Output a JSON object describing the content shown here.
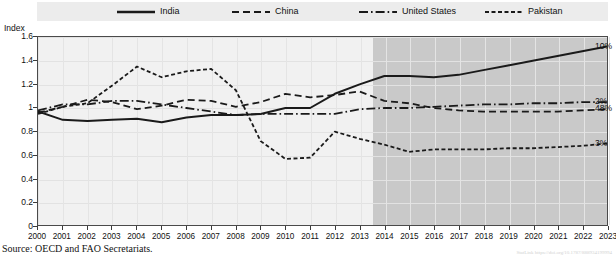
{
  "index_axis_title": "Index",
  "source_note": "Source:  OECD and FAO Secretariats.",
  "doi_note": "StatLink https://doi.org/10.1787/888934199994",
  "colors": {
    "line": "#1a1a1a",
    "plot_background": "#f1f1f1",
    "projection_shade": "#c9c9c9",
    "legend_background": "#ececec",
    "frame": "#4a4a4a"
  },
  "legend": {
    "items": [
      {
        "label": "India",
        "style": "solid",
        "name": "legend-item-india"
      },
      {
        "label": "China",
        "style": "dashed",
        "name": "legend-item-china"
      },
      {
        "label": "United States",
        "style": "dash-dot",
        "name": "legend-item-united-states"
      },
      {
        "label": "Pakistan",
        "style": "short-dashed",
        "name": "legend-item-pakistan"
      }
    ]
  },
  "chart_data": {
    "type": "line",
    "title": "",
    "xlabel": "",
    "ylabel": "Index",
    "ylim": [
      0,
      1.6
    ],
    "xlim": [
      2000,
      2023
    ],
    "grid": true,
    "legend_position": "top",
    "projection_start": 2013.5,
    "yticks": [
      "0",
      "0.2",
      "0.4",
      "0.6",
      "0.8",
      "1",
      "1.2",
      "1.4",
      "1.6"
    ],
    "ytick_values": [
      0,
      0.2,
      0.4,
      0.6,
      0.8,
      1.0,
      1.2,
      1.4,
      1.6
    ],
    "x": [
      2000,
      2001,
      2002,
      2003,
      2004,
      2005,
      2006,
      2007,
      2008,
      2009,
      2010,
      2011,
      2012,
      2013,
      2014,
      2015,
      2016,
      2017,
      2018,
      2019,
      2020,
      2021,
      2022,
      2023
    ],
    "categories": [
      "2000",
      "2001",
      "2002",
      "2003",
      "2004",
      "2005",
      "2006",
      "2007",
      "2008",
      "2009",
      "2010",
      "2011",
      "2012",
      "2013",
      "2014",
      "2015",
      "2016",
      "2017",
      "2018",
      "2019",
      "2020",
      "2021",
      "2022",
      "2023"
    ],
    "series": [
      {
        "name": "India",
        "style": "solid",
        "end_label": "10%",
        "values": [
          0.97,
          0.9,
          0.89,
          0.9,
          0.91,
          0.88,
          0.92,
          0.94,
          0.94,
          0.95,
          1.0,
          1.0,
          1.12,
          1.2,
          1.27,
          1.27,
          1.26,
          1.28,
          1.32,
          1.36,
          1.4,
          1.44,
          1.48,
          1.52
        ]
      },
      {
        "name": "China",
        "style": "dashed",
        "end_label": "48%",
        "values": [
          0.96,
          1.01,
          1.07,
          1.05,
          0.99,
          1.02,
          1.07,
          1.06,
          1.01,
          1.05,
          1.12,
          1.09,
          1.11,
          1.14,
          1.06,
          1.04,
          1.0,
          0.98,
          0.97,
          0.97,
          0.97,
          0.97,
          0.98,
          0.99
        ]
      },
      {
        "name": "United States",
        "style": "dash-dot",
        "end_label": "2%",
        "values": [
          0.98,
          1.03,
          1.03,
          1.06,
          1.06,
          1.03,
          1.0,
          0.97,
          0.94,
          0.95,
          0.95,
          0.95,
          0.95,
          0.99,
          1.0,
          1.0,
          1.01,
          1.02,
          1.03,
          1.03,
          1.04,
          1.04,
          1.05,
          1.05
        ]
      },
      {
        "name": "Pakistan",
        "style": "short-dashed",
        "end_label": "3%",
        "values": [
          0.95,
          1.01,
          1.04,
          1.19,
          1.35,
          1.26,
          1.31,
          1.33,
          1.15,
          0.72,
          0.57,
          0.58,
          0.8,
          0.74,
          0.69,
          0.63,
          0.65,
          0.65,
          0.65,
          0.66,
          0.66,
          0.67,
          0.68,
          0.7
        ]
      }
    ]
  }
}
